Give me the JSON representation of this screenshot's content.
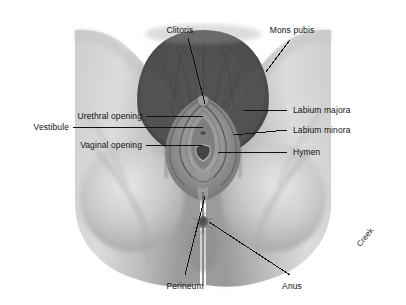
{
  "figure": {
    "signature": "Creek",
    "background_color": "#ffffff",
    "line_color": "#111111",
    "skin_light": "#dedede",
    "skin_mid": "#b9b9b9",
    "skin_dark": "#8e8e8e",
    "hair_color": "#4a4a4a"
  },
  "labels": {
    "clitoris": "Clitoris",
    "mons_pubis": "Mons pubis",
    "labium_majora": "Labium majora",
    "labium_minora": "Labium minora",
    "hymen": "Hymen",
    "urethral_opening": "Urethral opening",
    "vaginal_opening": "Vaginal opening",
    "vestibule": "Vestibule",
    "perineum": "Perineum",
    "anus": "Anus"
  }
}
